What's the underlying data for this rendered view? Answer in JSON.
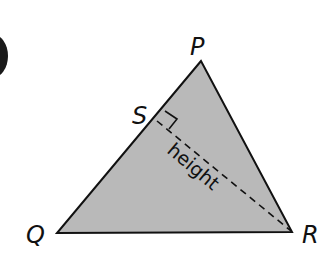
{
  "figure": {
    "type": "triangle-with-altitude",
    "vertices": {
      "P": {
        "label": "P"
      },
      "Q": {
        "label": "Q"
      },
      "R": {
        "label": "R"
      },
      "S": {
        "label": "S"
      }
    },
    "altitude_label": "height",
    "fill_color": "#b9b9b9",
    "stroke_color": "#111111",
    "marker": "right-angle at S"
  }
}
